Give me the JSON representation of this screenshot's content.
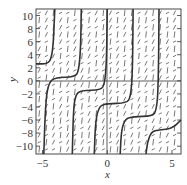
{
  "chart_data": {
    "type": "line",
    "subtype": "slope-field-with-solution-curves",
    "title": "",
    "xlabel": "x",
    "ylabel": "y",
    "xlim": [
      -5.5,
      5.7
    ],
    "ylim": [
      -11.2,
      11
    ],
    "xticks": [
      -5,
      0,
      5
    ],
    "yticks": [
      10,
      8,
      6,
      4,
      2,
      0,
      -2,
      -4,
      -6,
      -8,
      -10
    ],
    "xtick_labels": [
      "−5",
      "0",
      "5"
    ],
    "ytick_labels": [
      "10",
      "8",
      "6",
      "4",
      "2",
      "0",
      "−2",
      "−4",
      "−6",
      "−8",
      "−10"
    ],
    "grid": false,
    "slope_field": true,
    "series": [
      {
        "name": "solution-1",
        "points": [
          [
            -5.5,
            2.6
          ],
          [
            -4.6,
            2.6
          ],
          [
            -4.3,
            3.5
          ],
          [
            -4.15,
            6
          ],
          [
            -4.05,
            11
          ]
        ]
      },
      {
        "name": "solution-2",
        "points": [
          [
            -4.9,
            -11.2
          ],
          [
            -4.75,
            -3
          ],
          [
            -4.5,
            -0.2
          ],
          [
            -4,
            0.5
          ],
          [
            -2.5,
            0.6
          ],
          [
            -2.2,
            1.5
          ],
          [
            -2.05,
            5
          ],
          [
            -2.0,
            11
          ]
        ]
      },
      {
        "name": "solution-3",
        "points": [
          [
            -2.7,
            -11.2
          ],
          [
            -2.6,
            -4
          ],
          [
            -2.4,
            -2
          ],
          [
            -2,
            -1.5
          ],
          [
            -0.5,
            -1.4
          ],
          [
            -0.2,
            -0.5
          ],
          [
            -0.05,
            3
          ],
          [
            0.0,
            11
          ]
        ]
      },
      {
        "name": "solution-4",
        "points": [
          [
            -1.0,
            -11.2
          ],
          [
            -0.9,
            -6
          ],
          [
            -0.6,
            -3.8
          ],
          [
            0,
            -3.5
          ],
          [
            1.5,
            -3.4
          ],
          [
            1.8,
            -2.5
          ],
          [
            1.95,
            1
          ],
          [
            2.0,
            11
          ]
        ]
      },
      {
        "name": "solution-5",
        "points": [
          [
            1.0,
            -11.2
          ],
          [
            1.1,
            -7.5
          ],
          [
            1.4,
            -5.8
          ],
          [
            2,
            -5.5
          ],
          [
            3.5,
            -5.4
          ],
          [
            3.8,
            -4.5
          ],
          [
            3.95,
            -1
          ],
          [
            4.0,
            11
          ]
        ]
      },
      {
        "name": "solution-6",
        "points": [
          [
            3.0,
            -11.2
          ],
          [
            3.1,
            -9.5
          ],
          [
            3.4,
            -7.8
          ],
          [
            4,
            -7.5
          ],
          [
            5,
            -7.3
          ],
          [
            5.7,
            -6
          ]
        ]
      }
    ]
  }
}
